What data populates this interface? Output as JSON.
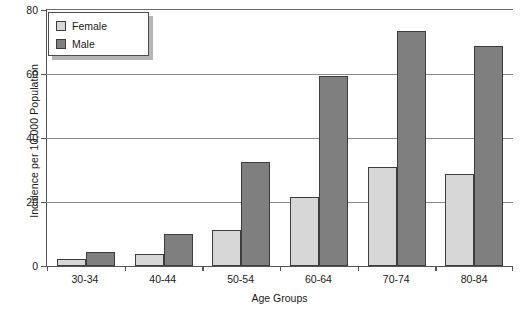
{
  "chart_data": {
    "type": "bar",
    "title": "",
    "xlabel": "Age Groups",
    "ylabel": "Incidence per 10,000 Population",
    "categories": [
      "30-34",
      "40-44",
      "50-54",
      "60-64",
      "70-74",
      "80-84"
    ],
    "series": [
      {
        "name": "Female",
        "color": "#d7d7d7",
        "values": [
          2.2,
          3.8,
          11.3,
          21.6,
          30.8,
          28.8
        ]
      },
      {
        "name": "Male",
        "color": "#7f7f7f",
        "values": [
          4.4,
          9.9,
          32.5,
          59.4,
          73.5,
          68.6
        ]
      }
    ],
    "ylim": [
      0,
      80
    ],
    "yticks": [
      0,
      20,
      40,
      60,
      80
    ],
    "ytick_labels": [
      "0",
      "20",
      "40",
      "60",
      "80"
    ],
    "grid": true,
    "legend_position": "top-left"
  }
}
